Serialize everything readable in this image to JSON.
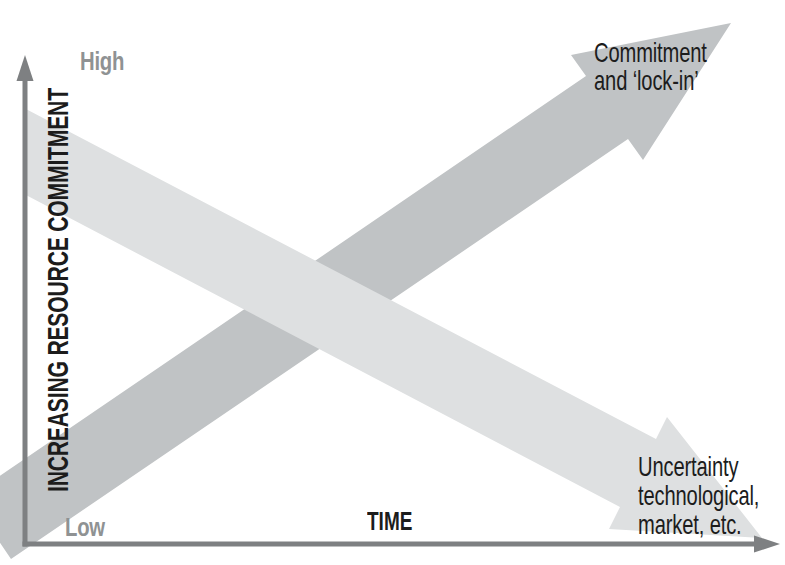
{
  "figure": {
    "y_axis": {
      "label": "INCREASING RESOURCE COMMITMENT",
      "top_tick_label": "High",
      "bottom_tick_label": "Low"
    },
    "x_axis": {
      "label": "TIME"
    },
    "arrows": [
      {
        "name": "commitment",
        "direction": "up-right",
        "label_lines": [
          "Commitment",
          "and ‘lock-in’"
        ]
      },
      {
        "name": "uncertainty",
        "direction": "down-right",
        "label_lines": [
          "Uncertainty",
          "technological,",
          "market, etc."
        ]
      }
    ]
  },
  "colors": {
    "commitment_arrow": "#c0c3c5",
    "uncertainty_arrow": "#dee0e1",
    "axis": "#7e8082",
    "gray_label": "#8f9293",
    "text": "#1c1c1c",
    "background": "#ffffff"
  }
}
